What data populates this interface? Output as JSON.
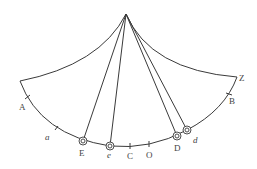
{
  "diagram": {
    "apex": {
      "x": 126,
      "y": 14
    },
    "corners": {
      "left": {
        "x": 20,
        "y": 81
      },
      "right": {
        "x": 237,
        "y": 77
      }
    },
    "labels": {
      "A": "A",
      "a": "a",
      "E": "E",
      "e": "e",
      "C": "C",
      "O": "O",
      "D": "D",
      "d": "d",
      "B": "B",
      "Z": "Z"
    },
    "stroke_color": "#3a3a3a"
  }
}
